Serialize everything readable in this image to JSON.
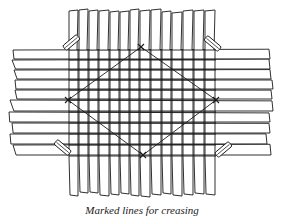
{
  "figure": {
    "caption": "Marked lines for creasing",
    "colors": {
      "ink": "#1a1a1a",
      "paper": "#ffffff"
    },
    "vertical_strips": {
      "count": 14,
      "x_edges": [
        69,
        79,
        89,
        99,
        110,
        120,
        130,
        140,
        151,
        162,
        172,
        183,
        194,
        205,
        216
      ],
      "top": 10,
      "bottom": 196
    },
    "horizontal_strips": {
      "count": 10,
      "y_edges": [
        50,
        60,
        70,
        80,
        90,
        100,
        112,
        123,
        134,
        145,
        156
      ],
      "left": 8,
      "right": 272
    },
    "diamond": {
      "top": [
        141,
        47
      ],
      "right": [
        216,
        100
      ],
      "bottom": [
        143,
        155
      ],
      "left": [
        68,
        100
      ]
    },
    "clips": [
      {
        "name": "top-left",
        "x": 66,
        "y": 47,
        "angle": 50
      },
      {
        "name": "top-right",
        "x": 218,
        "y": 48,
        "angle": -50
      },
      {
        "name": "bottom-left",
        "x": 68,
        "y": 152,
        "angle": -50
      },
      {
        "name": "bottom-right",
        "x": 218,
        "y": 154,
        "angle": 50
      }
    ]
  }
}
